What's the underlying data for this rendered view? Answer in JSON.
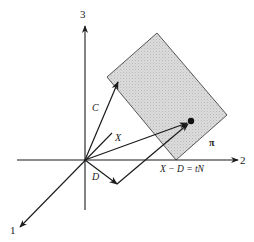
{
  "diagram": {
    "axes": {
      "axis1_label": "1",
      "axis2_label": "2",
      "axis3_label": "3"
    },
    "vectors": {
      "c_label": "C",
      "x_label": "X",
      "d_label": "D",
      "xd_label": "X − D = tN"
    },
    "plane_label": "π",
    "colors": {
      "plane_fill": "#d4d4d4",
      "line": "#1a1a1a",
      "background": "#ffffff"
    }
  }
}
